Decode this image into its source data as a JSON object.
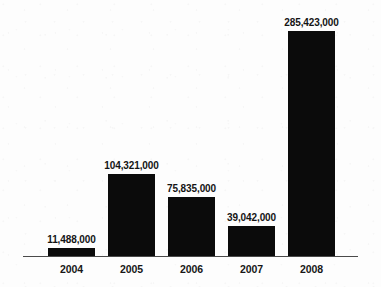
{
  "chart_data": {
    "type": "bar",
    "title": "",
    "subtitle": "",
    "xlabel": "",
    "ylabel": "",
    "grid": false,
    "legend": false,
    "categories": [
      "2004",
      "2005",
      "2006",
      "2007",
      "2008"
    ],
    "values": [
      11488000,
      39042000,
      75835000,
      104321000,
      285423000
    ],
    "series": [
      {
        "name": "",
        "values": [
          11488000,
          104321000,
          75835000,
          39042000,
          285423000
        ]
      }
    ],
    "ylim": [
      0,
      285423000
    ],
    "bars": [
      {
        "category": "2004",
        "value": 11488000,
        "value_label": "11,488,000"
      },
      {
        "category": "2005",
        "value": 104321000,
        "value_label": "104,321,000"
      },
      {
        "category": "2006",
        "value": 75835000,
        "value_label": "75,835,000"
      },
      {
        "category": "2007",
        "value": 39042000,
        "value_label": "39,042,000"
      },
      {
        "category": "2008",
        "value": 285423000,
        "value_label": "285,423,000"
      }
    ],
    "bar_color": "#0b0b0b",
    "axis_color": "#4a4a4a",
    "background_color": "#fdfdfd"
  }
}
